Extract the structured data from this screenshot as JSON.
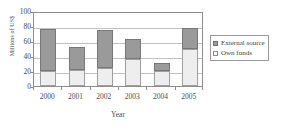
{
  "chart_data": {
    "type": "bar",
    "stacked": true,
    "title": "",
    "xlabel": "Year",
    "ylabel": "Millions of US$",
    "categories": [
      "2000",
      "2001",
      "2002",
      "2003",
      "2004",
      "2005"
    ],
    "series": [
      {
        "name": "Own funds",
        "values": [
          20,
          22,
          24,
          36,
          20,
          50
        ]
      },
      {
        "name": "External source",
        "values": [
          56,
          30,
          51,
          27,
          11,
          28
        ]
      }
    ],
    "totals": [
      76,
      52,
      75,
      63,
      31,
      78
    ],
    "ylim": [
      0,
      100
    ],
    "yticks": [
      0,
      20,
      40,
      60,
      80,
      100
    ],
    "ytick_labels": [
      "0",
      "20",
      "40",
      "60",
      "80",
      "100"
    ],
    "grid": true,
    "grid_axis": "y",
    "legend_position": "right",
    "legend": [
      {
        "label": "External source",
        "swatch": "external",
        "color": "#9a9a9a"
      },
      {
        "label": "Own funds",
        "swatch": "own",
        "color": "#ffffff"
      }
    ],
    "colors": {
      "external_source": "#9a9a9a",
      "own_funds": "#eeeeee",
      "axis": "#8d8d8d",
      "gridline": "#c2c2c2",
      "text": "#4a4a4a"
    }
  }
}
